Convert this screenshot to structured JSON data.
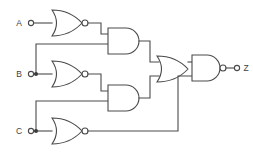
{
  "diagram": {
    "type": "logic-gate-schematic",
    "line_color": "#4a4a4a",
    "background_color": "#ffffff",
    "label_color": "#3f3f3f"
  },
  "inputs": [
    {
      "id": "A",
      "label": "A",
      "terminal_x": 31,
      "terminal_y": 23
    },
    {
      "id": "B",
      "label": "B",
      "terminal_x": 31,
      "terminal_y": 74
    },
    {
      "id": "C",
      "label": "C",
      "terminal_x": 31,
      "terminal_y": 131
    }
  ],
  "outputs": [
    {
      "id": "Z",
      "label": "Z",
      "terminal_x": 225,
      "terminal_y": 68
    }
  ],
  "gates": [
    {
      "id": "nor1",
      "type": "NOR",
      "label": "NOR",
      "inputs": [
        "A"
      ],
      "output": "n1"
    },
    {
      "id": "nor2",
      "type": "NOR",
      "label": "NOR",
      "inputs": [
        "B"
      ],
      "output": "n2"
    },
    {
      "id": "nor3",
      "type": "NOR",
      "label": "NOR",
      "inputs": [
        "C"
      ],
      "output": "n3"
    },
    {
      "id": "and1",
      "type": "AND",
      "label": "AND",
      "inputs": [
        "n1",
        "B"
      ],
      "output": "a1"
    },
    {
      "id": "and2",
      "type": "AND",
      "label": "AND",
      "inputs": [
        "n2",
        "C"
      ],
      "output": "a2"
    },
    {
      "id": "or1",
      "type": "OR",
      "label": "OR",
      "inputs": [
        "a1",
        "a2"
      ],
      "output": "o1"
    },
    {
      "id": "nand1",
      "type": "NAND",
      "label": "NAND",
      "inputs": [
        "o1",
        "n3"
      ],
      "output": "Z"
    }
  ],
  "junctions": [
    {
      "id": "junction-b",
      "on_net": "B",
      "x": 36,
      "y": 74
    },
    {
      "id": "junction-c",
      "on_net": "C",
      "x": 36,
      "y": 131
    }
  ],
  "nets": [
    {
      "id": "A",
      "from": "input-A",
      "to": "nor1"
    },
    {
      "id": "B",
      "from": "input-B",
      "to": "nor2, and1"
    },
    {
      "id": "C",
      "from": "input-C",
      "to": "nor3, and2"
    },
    {
      "id": "n1",
      "from": "nor1",
      "to": "and1"
    },
    {
      "id": "n2",
      "from": "nor2",
      "to": "and2"
    },
    {
      "id": "n3",
      "from": "nor3",
      "to": "nand1"
    },
    {
      "id": "a1",
      "from": "and1",
      "to": "or1"
    },
    {
      "id": "a2",
      "from": "and2",
      "to": "or1"
    },
    {
      "id": "o1",
      "from": "or1",
      "to": "nand1"
    },
    {
      "id": "Z",
      "from": "nand1",
      "to": "output-Z"
    }
  ]
}
